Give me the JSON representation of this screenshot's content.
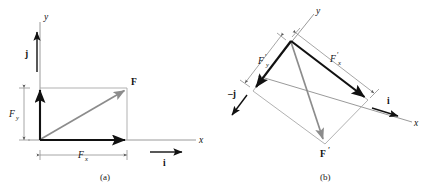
{
  "figure": {
    "panels": [
      {
        "id": "panel-a",
        "caption": "(a)",
        "description": "Force F resolved into components Fx and Fy along an upright x-y axis pair with unit vectors i and j",
        "axis_labels": {
          "x": "x",
          "y": "y"
        },
        "unit_vectors": [
          {
            "name": "i",
            "label": "i",
            "direction": "+x"
          },
          {
            "name": "j",
            "label": "j",
            "direction": "+y"
          }
        ],
        "vectors": [
          {
            "name": "resultant",
            "label": "F",
            "color": "#8c8c8c"
          },
          {
            "name": "x-component",
            "label": "Fx",
            "base": "F",
            "subscript": "x",
            "color": "#111111"
          },
          {
            "name": "y-component",
            "label": "Fy",
            "base": "F",
            "subscript": "y",
            "color": "#111111"
          }
        ],
        "dimension_labels": [
          {
            "name": "fx-dimension",
            "base": "F",
            "subscript": "x"
          },
          {
            "name": "fy-dimension",
            "base": "F",
            "subscript": "y"
          }
        ]
      },
      {
        "id": "panel-b",
        "caption": "(b)",
        "description": "Force F-prime resolved into components along a rotated x-y axis pair with unit vectors i and minus j",
        "axis_labels": {
          "x": "x",
          "y": "y"
        },
        "unit_vectors": [
          {
            "name": "i",
            "label": "i",
            "direction": "rotated +x"
          },
          {
            "name": "minus-j",
            "label": "–j",
            "direction": "rotated –y"
          }
        ],
        "vectors": [
          {
            "name": "resultant",
            "label": "F′",
            "color": "#8c8c8c"
          },
          {
            "name": "x-component",
            "label": "F′x",
            "base": "F",
            "prime": "′",
            "subscript": "x",
            "color": "#111111"
          },
          {
            "name": "y-component",
            "label": "F′y",
            "base": "F",
            "prime": "′",
            "subscript": "y",
            "color": "#111111"
          }
        ],
        "dimension_labels": [
          {
            "name": "fx-prime-dimension",
            "base": "F",
            "prime": "′",
            "subscript": "x"
          },
          {
            "name": "fy-prime-dimension",
            "base": "F",
            "prime": "′",
            "subscript": "y"
          }
        ]
      }
    ],
    "glyphs": {
      "F": "F",
      "F_prime": "F",
      "prime": "′",
      "sub_x": "x",
      "sub_y": "y",
      "axis_x": "x",
      "axis_y": "y",
      "unit_i": "i",
      "unit_j": "j",
      "unit_minus_j": "–j",
      "caption_a": "(a)",
      "caption_b": "(b)"
    },
    "colors": {
      "resultant": "#8c8c8c",
      "component": "#111111",
      "construction": "#a8a8a8",
      "axis": "#9a9a9a",
      "text": "#111111",
      "background": "#ffffff"
    }
  }
}
